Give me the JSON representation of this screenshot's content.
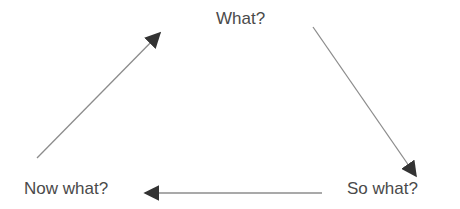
{
  "diagram": {
    "type": "cycle",
    "nodes": [
      {
        "id": "what",
        "label": "What?"
      },
      {
        "id": "so_what",
        "label": "So what?"
      },
      {
        "id": "now_what",
        "label": "Now what?"
      }
    ],
    "edges": [
      {
        "from": "what",
        "to": "so_what"
      },
      {
        "from": "so_what",
        "to": "now_what"
      },
      {
        "from": "now_what",
        "to": "what"
      }
    ],
    "colors": {
      "text": "#4a4a4a",
      "line": "#8c8c8c",
      "arrowhead": "#333333",
      "background": "#ffffff"
    }
  }
}
